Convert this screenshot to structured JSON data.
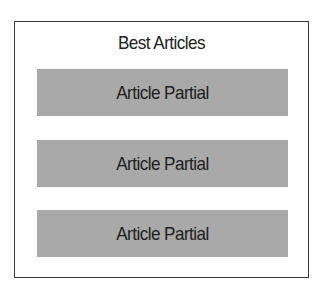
{
  "container": {
    "title": "Best Articles",
    "items": [
      {
        "label": "Article Partial"
      },
      {
        "label": "Article Partial"
      },
      {
        "label": "Article Partial"
      }
    ]
  },
  "colors": {
    "border": "#3a3a3a",
    "bar_fill": "#a9a9a9",
    "text": "#1e1e1e"
  }
}
